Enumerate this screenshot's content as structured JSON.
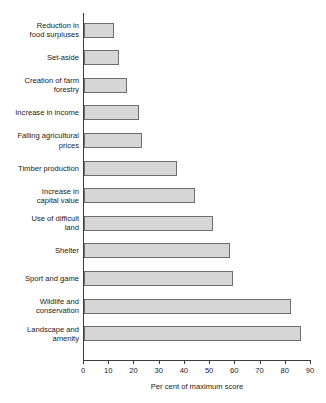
{
  "chart_data": {
    "type": "bar",
    "orientation": "horizontal",
    "title": "",
    "xlabel": "Per cent of maximum score",
    "ylabel": "",
    "xlim": [
      0,
      90
    ],
    "xticks": [
      0,
      10,
      20,
      30,
      40,
      50,
      60,
      70,
      80,
      90
    ],
    "grid": false,
    "legend": null,
    "bar_fill_color": "#d6d6d6",
    "bar_border_color": "#6e6e6e",
    "axis_color": "#3c3c3c",
    "categories": [
      "Reduction in\nfood surpluses",
      "Set-aside",
      "Creation of farm\nforestry",
      "Increase in income",
      "Falling agricultural\nprices",
      "Timber production",
      "Increase in\ncapital value",
      "Use of difficult\nland",
      "Shelter",
      "Sport and game",
      "Wildlife and\nconservation",
      "Landscape and\namenity"
    ],
    "values": [
      12,
      14,
      17,
      22,
      23,
      37,
      44,
      51,
      58,
      59,
      82,
      86
    ]
  }
}
